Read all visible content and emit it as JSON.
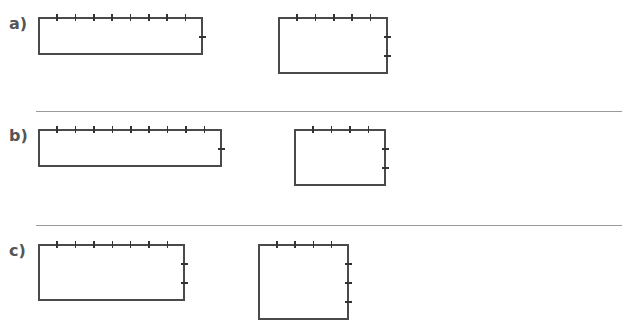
{
  "page": {
    "stroke_color": "#4a4a4a",
    "tick_color": "#333333",
    "label_color": "#555555",
    "separator_color": "#9a9a9a"
  },
  "problems": [
    {
      "label": "a)",
      "label_pos": [
        9,
        16
      ],
      "rectangles": [
        {
          "left": 38,
          "top": 17,
          "right": 203,
          "bottom": 55,
          "top_divisions": 9,
          "right_divisions": 2
        },
        {
          "left": 278,
          "top": 17,
          "right": 388,
          "bottom": 74,
          "top_divisions": 6,
          "right_divisions": 3
        }
      ]
    },
    {
      "label": "b)",
      "label_pos": [
        9,
        128
      ],
      "rectangles": [
        {
          "left": 38,
          "top": 129,
          "right": 222,
          "bottom": 167,
          "top_divisions": 10,
          "right_divisions": 2
        },
        {
          "left": 294,
          "top": 129,
          "right": 386,
          "bottom": 186,
          "top_divisions": 5,
          "right_divisions": 3
        }
      ]
    },
    {
      "label": "c)",
      "label_pos": [
        9,
        243
      ],
      "rectangles": [
        {
          "left": 38,
          "top": 244,
          "right": 185,
          "bottom": 301,
          "top_divisions": 8,
          "right_divisions": 3
        },
        {
          "left": 258,
          "top": 244,
          "right": 349,
          "bottom": 320,
          "top_divisions": 5,
          "right_divisions": 4
        }
      ]
    }
  ],
  "separators": [
    {
      "x1": 36,
      "x2": 622,
      "y": 111
    },
    {
      "x1": 36,
      "x2": 622,
      "y": 225
    }
  ]
}
